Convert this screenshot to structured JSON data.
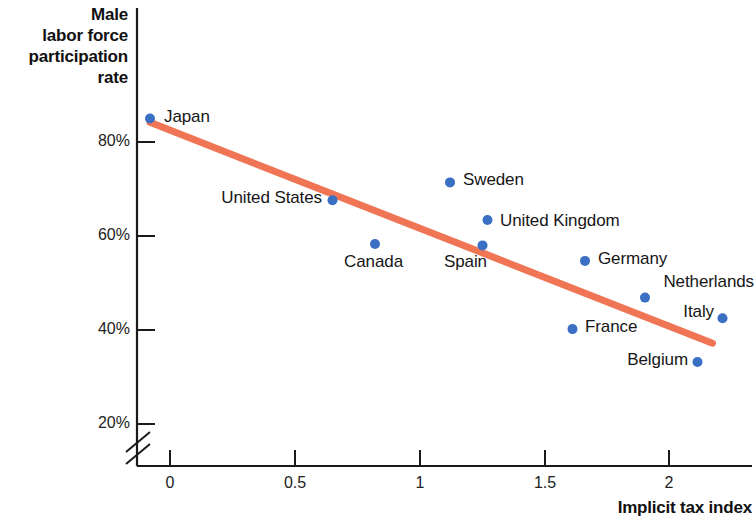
{
  "chart_data": {
    "type": "scatter",
    "title": "",
    "ylabel": "Male labor force participation rate",
    "xlabel": "Implicit tax index",
    "xlim": [
      -0.18,
      2.35
    ],
    "ylim": [
      18,
      90
    ],
    "grid": false,
    "legend_position": "none",
    "y_axis_break": true,
    "y_break_note": "axis broken below 20%",
    "xticks": [
      0,
      0.5,
      1,
      1.5,
      2
    ],
    "xticklabels": [
      "0",
      "0.5",
      "1",
      "1.5",
      "2"
    ],
    "yticks": [
      20,
      40,
      60,
      80
    ],
    "yticklabels": [
      "20%",
      "40%",
      "60%",
      "80%"
    ],
    "point_color": "#3a6fc4",
    "trendline_color": "#ef7555",
    "points": [
      {
        "label": "Japan",
        "x": -0.08,
        "y": 85.0,
        "label_side": "right"
      },
      {
        "label": "United States",
        "x": 0.65,
        "y": 67.6,
        "label_side": "left"
      },
      {
        "label": "Canada",
        "x": 0.82,
        "y": 58.3,
        "label_side": "below"
      },
      {
        "label": "Sweden",
        "x": 1.12,
        "y": 71.4,
        "label_side": "right"
      },
      {
        "label": "United Kingdom",
        "x": 1.27,
        "y": 63.4,
        "label_side": "right"
      },
      {
        "label": "Spain",
        "x": 1.25,
        "y": 58.0,
        "label_side": "below"
      },
      {
        "label": "Germany",
        "x": 1.66,
        "y": 54.7,
        "label_side": "right"
      },
      {
        "label": "Netherlands",
        "x": 1.9,
        "y": 46.9,
        "label_side": "above"
      },
      {
        "label": "Italy",
        "x": 2.21,
        "y": 42.5,
        "label_side": "left"
      },
      {
        "label": "France",
        "x": 1.61,
        "y": 40.2,
        "label_side": "right"
      },
      {
        "label": "Belgium",
        "x": 2.11,
        "y": 33.2,
        "label_side": "left"
      }
    ],
    "trendline": {
      "x_start": -0.08,
      "y_start": 84.2,
      "x_end": 2.17,
      "y_end": 37.2
    }
  },
  "axis": {
    "y_title_lines": [
      "Male",
      "labor force",
      "participation",
      "rate"
    ],
    "y_title_line_0": "Male",
    "y_title_line_1": "labor force",
    "y_title_line_2": "participation",
    "y_title_line_3": "rate",
    "x_title": "Implicit tax index",
    "y_tick_0": "20%",
    "y_tick_1": "40%",
    "y_tick_2": "60%",
    "y_tick_3": "80%",
    "x_tick_0": "0",
    "x_tick_1": "0.5",
    "x_tick_2": "1",
    "x_tick_3": "1.5",
    "x_tick_4": "2"
  },
  "labels": {
    "japan": "Japan",
    "united_states": "United States",
    "canada": "Canada",
    "sweden": "Sweden",
    "united_kingdom": "United Kingdom",
    "spain": "Spain",
    "germany": "Germany",
    "netherlands": "Netherlands",
    "italy": "Italy",
    "france": "France",
    "belgium": "Belgium"
  }
}
